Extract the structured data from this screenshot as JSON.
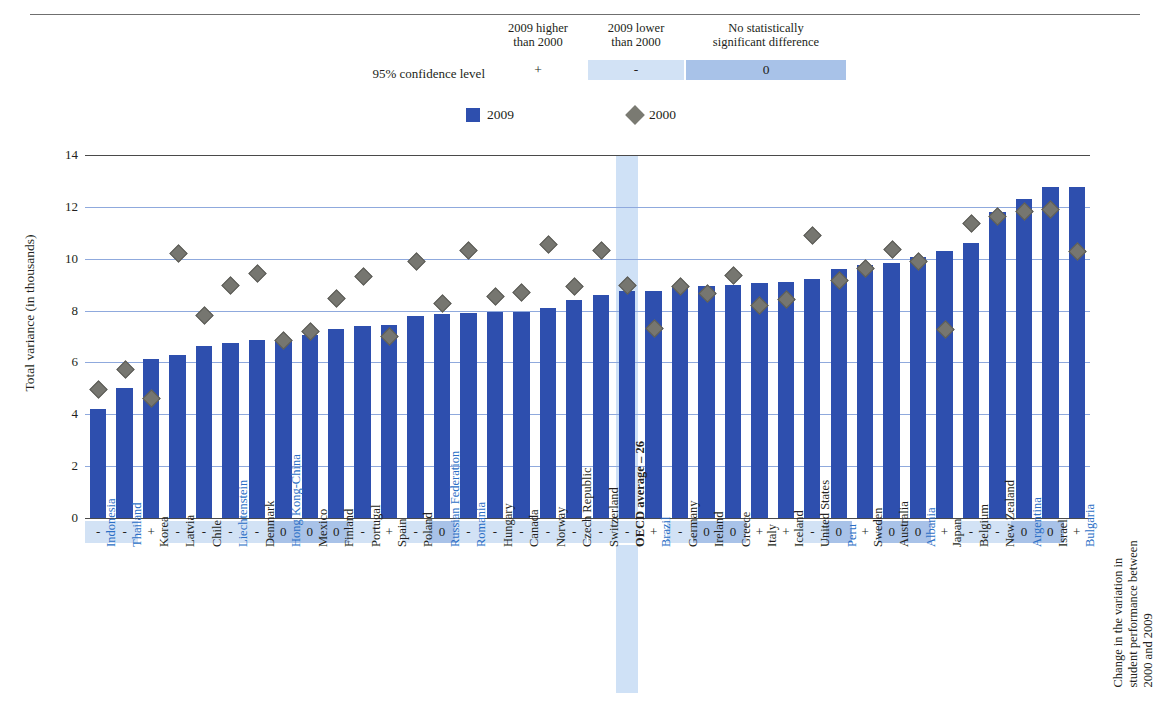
{
  "title": "",
  "significance_legend": {
    "confidence_label": "95% confidence level",
    "headers": [
      "2009 higher than 2000",
      "2009 lower than 2000",
      "No statistically significant difference"
    ],
    "header_lines": [
      [
        "2009 higher",
        "than 2000"
      ],
      [
        "2009 lower",
        "than 2000"
      ],
      [
        "No statistically",
        "significant difference"
      ]
    ],
    "symbols": [
      "+",
      "-",
      "0"
    ],
    "colors": {
      "higher": "#ffffff",
      "lower": "#d2e2f5",
      "nodiff": "#a8c2e8"
    }
  },
  "series_legend": [
    {
      "label": "2009",
      "marker": "bar-swatch",
      "color": "#2e4fae"
    },
    {
      "label": "2000",
      "marker": "diamond-swatch",
      "color": "#7a7a72"
    }
  ],
  "axes": {
    "y_label": "Total variance (in thousands)",
    "y_ticks": [
      0,
      2,
      4,
      6,
      8,
      10,
      12,
      14
    ],
    "y_min": 0,
    "y_max": 14,
    "right_label": "Change in the variation in student performance between 2000 and 2009",
    "right_label_lines": [
      "Change in the variation in",
      "student performance between",
      "2000 and 2009"
    ]
  },
  "chart_data": {
    "type": "bar",
    "title": "",
    "xlabel": "",
    "ylabel": "Total variance (in thousands)",
    "ylim": [
      0,
      14
    ],
    "grid": true,
    "legend_position": "top-center",
    "categories": [
      "Indonesia",
      "Thailand",
      "Korea",
      "Latvia",
      "Chile",
      "Liechtenstein",
      "Denmark",
      "Hong Kong-China",
      "Mexico",
      "Finland",
      "Portugal",
      "Spain",
      "Poland",
      "Russian Federation",
      "Romania",
      "Hungary",
      "Canada",
      "Norway",
      "Czech Republic",
      "Switzerland",
      "OECD average – 26",
      "Brazil",
      "Germany",
      "Ireland",
      "Greece",
      "Italy",
      "Iceland",
      "United States",
      "Peru",
      "Sweden",
      "Australia",
      "Albania",
      "Japan",
      "Belgium",
      "New Zealand",
      "Argentina",
      "Israel",
      "Bulgaria"
    ],
    "series": [
      {
        "name": "2009",
        "type": "bar",
        "color": "#2e4fae",
        "values": [
          4.2,
          5.0,
          6.15,
          6.3,
          6.65,
          6.75,
          6.85,
          6.85,
          7.05,
          7.3,
          7.4,
          7.45,
          7.8,
          7.85,
          7.9,
          7.95,
          7.95,
          8.1,
          8.4,
          8.6,
          8.75,
          8.75,
          8.9,
          8.95,
          9.0,
          9.05,
          9.1,
          9.2,
          9.6,
          9.75,
          9.85,
          10.05,
          10.3,
          10.6,
          11.8,
          12.3,
          12.75,
          12.75
        ]
      },
      {
        "name": "2000",
        "type": "scatter",
        "marker": "diamond",
        "color": "#767670",
        "values": [
          5.0,
          5.75,
          4.65,
          10.25,
          7.85,
          9.0,
          9.45,
          6.9,
          7.25,
          8.5,
          9.35,
          7.05,
          9.95,
          8.3,
          10.35,
          8.6,
          8.75,
          10.6,
          8.95,
          10.35,
          9.0,
          7.35,
          8.95,
          8.7,
          9.4,
          8.25,
          8.45,
          10.95,
          9.2,
          9.65,
          10.4,
          9.95,
          7.3,
          11.4,
          11.65,
          11.85,
          11.95,
          10.3
        ]
      }
    ],
    "significance": [
      "-",
      "-",
      "+",
      "-",
      "-",
      "-",
      "-",
      "0",
      "0",
      "0",
      "-",
      "+",
      "-",
      "0",
      "-",
      "-",
      "-",
      "-",
      "-",
      "-",
      "-",
      "+",
      "-",
      "0",
      "0",
      "+",
      "+",
      "-",
      "0",
      "+",
      "0",
      "0",
      "+",
      "-",
      "-",
      "0",
      "0",
      "+"
    ],
    "highlight_category": "OECD average – 26",
    "blue_label_categories": [
      "Indonesia",
      "Thailand",
      "Liechtenstein",
      "Hong Kong-China",
      "Russian Federation",
      "Romania",
      "Brazil",
      "Peru",
      "Albania",
      "Argentina",
      "Bulgaria"
    ]
  }
}
